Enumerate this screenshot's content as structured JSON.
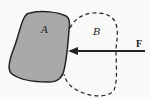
{
  "diagram": {
    "labels": {
      "body_a": "A",
      "body_b": "B",
      "force": "F"
    },
    "colors": {
      "body_a_fill": "#a9a9a9",
      "stroke": "#222222",
      "background": "#f9f9f7"
    }
  }
}
